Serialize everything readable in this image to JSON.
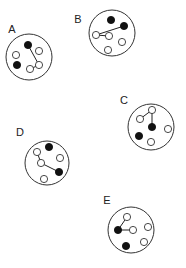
{
  "diagram": {
    "legend": {
      "filled_color": "#111111",
      "open_color": "#ffffff"
    },
    "panels": [
      {
        "label": "A",
        "atoms": [
          {
            "id": "a1",
            "type": "filled"
          },
          {
            "id": "a2",
            "type": "open"
          },
          {
            "id": "a3",
            "type": "open"
          },
          {
            "id": "a4",
            "type": "filled"
          },
          {
            "id": "a5",
            "type": "open"
          },
          {
            "id": "a6",
            "type": "open"
          }
        ],
        "bonds": [
          [
            "a1",
            "a5"
          ],
          [
            "a5",
            "a6"
          ]
        ]
      },
      {
        "label": "B",
        "atoms": [
          {
            "id": "b1",
            "type": "filled"
          },
          {
            "id": "b2",
            "type": "filled"
          },
          {
            "id": "b3",
            "type": "open"
          },
          {
            "id": "b4",
            "type": "open"
          },
          {
            "id": "b5",
            "type": "open"
          },
          {
            "id": "b6",
            "type": "open"
          }
        ],
        "bonds": [
          [
            "b2",
            "b3"
          ],
          [
            "b3",
            "b4"
          ]
        ]
      },
      {
        "label": "C",
        "atoms": [
          {
            "id": "c1",
            "type": "open"
          },
          {
            "id": "c2",
            "type": "open"
          },
          {
            "id": "c3",
            "type": "filled"
          },
          {
            "id": "c4",
            "type": "open"
          },
          {
            "id": "c5",
            "type": "filled"
          },
          {
            "id": "c6",
            "type": "open"
          }
        ],
        "bonds": [
          [
            "c2",
            "c1"
          ],
          [
            "c1",
            "c3"
          ]
        ]
      },
      {
        "label": "D",
        "atoms": [
          {
            "id": "d1",
            "type": "filled"
          },
          {
            "id": "d2",
            "type": "open"
          },
          {
            "id": "d3",
            "type": "open"
          },
          {
            "id": "d4",
            "type": "open"
          },
          {
            "id": "d5",
            "type": "filled"
          },
          {
            "id": "d6",
            "type": "open"
          }
        ],
        "bonds": [
          [
            "d2",
            "d4"
          ],
          [
            "d4",
            "d5"
          ]
        ]
      },
      {
        "label": "E",
        "atoms": [
          {
            "id": "e1",
            "type": "open"
          },
          {
            "id": "e2",
            "type": "open"
          },
          {
            "id": "e3",
            "type": "filled"
          },
          {
            "id": "e4",
            "type": "open"
          },
          {
            "id": "e5",
            "type": "open"
          },
          {
            "id": "e6",
            "type": "filled"
          }
        ],
        "bonds": [
          [
            "e3",
            "e1"
          ],
          [
            "e3",
            "e4"
          ]
        ]
      }
    ]
  }
}
